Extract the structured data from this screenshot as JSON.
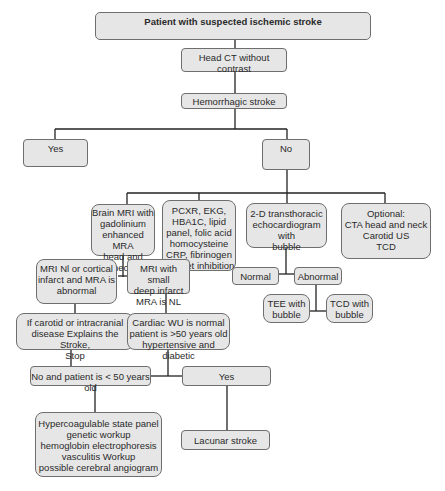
{
  "diagram": {
    "nodes": [
      {
        "id": "start",
        "label": "Patient with suspected ischemic stroke"
      },
      {
        "id": "head_ct",
        "label": "Head CT without contrast"
      },
      {
        "id": "hemorrhagic",
        "label": "Hemorrhagic stroke"
      },
      {
        "id": "yes1",
        "label": "Yes"
      },
      {
        "id": "no1",
        "label": "No"
      },
      {
        "id": "brain_mri",
        "label": "Brain MRI with\ngadolinium\nenhanced MRA\nhead and neck"
      },
      {
        "id": "labs",
        "label": "PCXR, EKG,\nHBA1C, lipid\npanel, folic acid\nhomocysteine\nCRP, fibrinogen\nplatelet inhibition"
      },
      {
        "id": "echo",
        "label": "2-D transthoracic\nechocardiogram with\nbubble"
      },
      {
        "id": "optional",
        "label": "Optional:\nCTA head and neck\nCarotid US\nTCD"
      },
      {
        "id": "mri_nl_cortical",
        "label": "MRI Nl or cortical\ninfarct and MRA is\nabnormal"
      },
      {
        "id": "mri_small_deep",
        "label": "MRI with small\ndeep infarct\nMRA is NL"
      },
      {
        "id": "normal",
        "label": "Normal"
      },
      {
        "id": "abnormal",
        "label": "Abnormal"
      },
      {
        "id": "tee",
        "label": "TEE with\nbubble"
      },
      {
        "id": "tcd",
        "label": "TCD with\nbubble"
      },
      {
        "id": "carotid_stop",
        "label": "If carotid or intracranial\ndisease Explains the Stroke,\nStop"
      },
      {
        "id": "cardiac_wu",
        "label": "Cardiac WU is normal\npatient is >50 years old\nhypertensive and diabetic"
      },
      {
        "id": "no_under50",
        "label": "No and patient is < 50 years old"
      },
      {
        "id": "yes2",
        "label": "Yes"
      },
      {
        "id": "hypercoag",
        "label": "Hypercoagulable state panel\ngenetic workup\nhemoglobin electrophoresis\nvasculitis Workup\npossible cerebral angiogram"
      },
      {
        "id": "lacunar",
        "label": "Lacunar stroke"
      }
    ]
  }
}
